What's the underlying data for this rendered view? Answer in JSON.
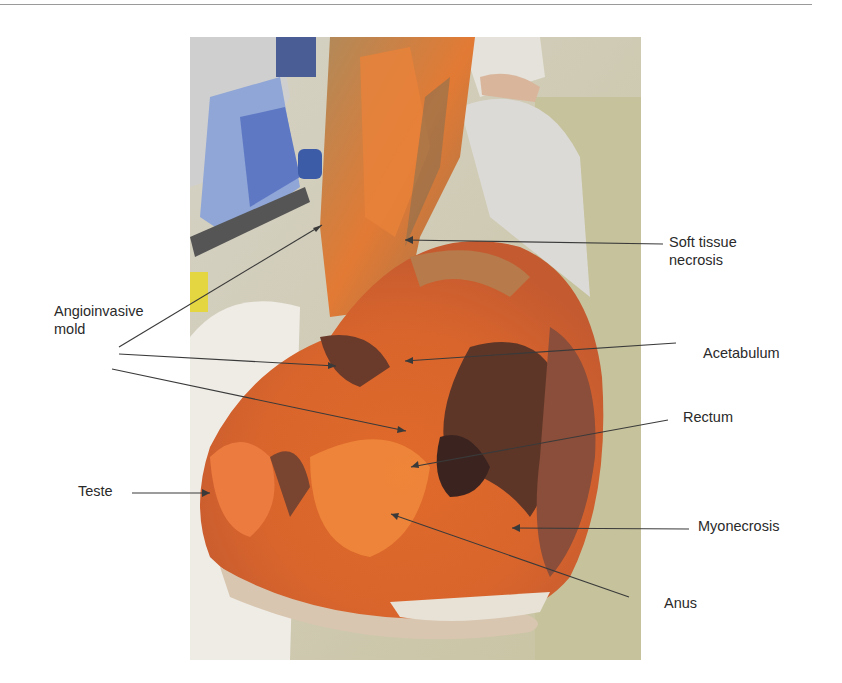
{
  "figure": {
    "labels": [
      {
        "id": "soft-tissue-necrosis",
        "lines": [
          "Soft tissue",
          "necrosis"
        ],
        "x": 669,
        "y": 233
      },
      {
        "id": "angioinvasive-mold",
        "lines": [
          "Angioinvasive",
          "mold"
        ],
        "x": 54,
        "y": 302
      },
      {
        "id": "acetabulum",
        "lines": [
          "Acetabulum"
        ],
        "x": 703,
        "y": 344
      },
      {
        "id": "rectum",
        "lines": [
          "Rectum"
        ],
        "x": 683,
        "y": 408
      },
      {
        "id": "teste",
        "lines": [
          "Teste"
        ],
        "x": 78,
        "y": 482
      },
      {
        "id": "myonecrosis",
        "lines": [
          "Myonecrosis"
        ],
        "x": 698,
        "y": 517
      },
      {
        "id": "anus",
        "lines": [
          "Anus"
        ],
        "x": 664,
        "y": 594
      }
    ],
    "colors": {
      "tissue_orange": "#e8782e",
      "necrotic_dark": "#5a3a30",
      "drape_white": "#eeeae0",
      "background_green": "#c9c6a4",
      "leader_line": "#3a3a3a"
    }
  }
}
